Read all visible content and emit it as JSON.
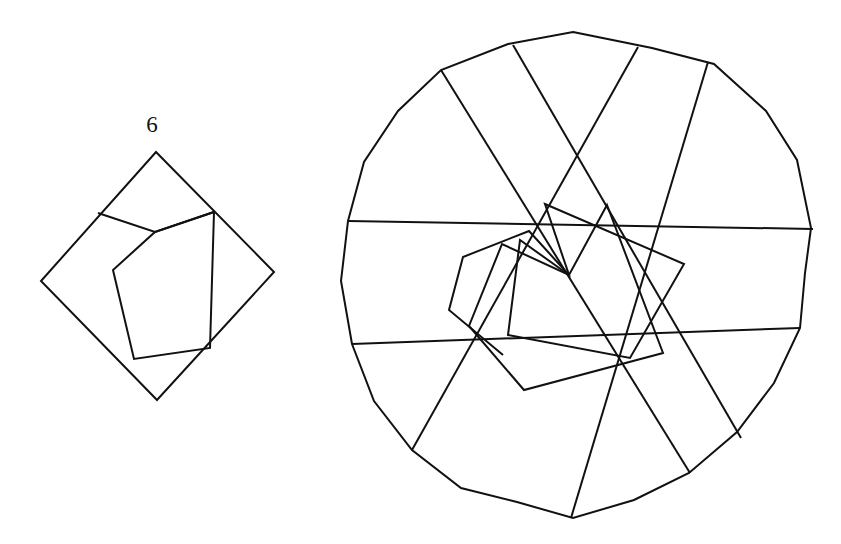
{
  "figure": {
    "kind": "geometric-line-drawing",
    "background_color": "#ffffff",
    "line_color": "#111111",
    "line_width": 2
  },
  "labels": [
    {
      "name": "figure-number",
      "text": "6",
      "x": 152,
      "y": 132,
      "font_size": 23
    }
  ],
  "chart_data": {
    "type": "line",
    "title": "",
    "xlabel": "",
    "ylabel": "",
    "grid": false,
    "legend": "none",
    "xlim": [
      0,
      841
    ],
    "ylim": [
      0,
      544
    ],
    "note": "Coordinates are image pixel positions, y increases downward. Each series is one closed or open polyline of the drawing.",
    "series": [
      {
        "name": "small-outer-square",
        "closed": true,
        "points": [
          [
            156,
            152
          ],
          [
            274,
            272
          ],
          [
            157,
            400
          ],
          [
            41,
            281
          ]
        ]
      },
      {
        "name": "small-inner-whirl",
        "closed": true,
        "points": [
          [
            98,
            213
          ],
          [
            214,
            212
          ],
          [
            210,
            348
          ],
          [
            134,
            359
          ],
          [
            113,
            270
          ],
          [
            155,
            232
          ]
        ]
      },
      {
        "name": "small-chord-upper-left",
        "closed": false,
        "points": [
          [
            98,
            213
          ],
          [
            155,
            232
          ]
        ]
      },
      {
        "name": "small-chord-upper-right",
        "closed": false,
        "points": [
          [
            155,
            232
          ],
          [
            214,
            212
          ]
        ]
      },
      {
        "name": "large-outer-14gon",
        "closed": true,
        "points": [
          [
            573,
            32
          ],
          [
            651,
            48
          ],
          [
            714,
            63
          ],
          [
            766,
            110
          ],
          [
            797,
            160
          ],
          [
            811,
            227
          ],
          [
            805,
            273
          ],
          [
            799,
            327
          ],
          [
            774,
            382
          ],
          [
            737,
            432
          ],
          [
            688,
            473
          ],
          [
            634,
            500
          ],
          [
            573,
            518
          ],
          [
            517,
            502
          ],
          [
            460,
            488
          ],
          [
            412,
            449
          ],
          [
            374,
            400
          ],
          [
            351,
            343
          ],
          [
            341,
            281
          ],
          [
            348,
            222
          ],
          [
            364,
            162
          ],
          [
            398,
            111
          ],
          [
            444,
            69
          ],
          [
            508,
            44
          ]
        ]
      },
      {
        "name": "large-ring1-polygon",
        "closed": true,
        "points": [
          [
            513,
            45
          ],
          [
            736,
            271
          ],
          [
            640,
            487
          ],
          [
            358,
            448
          ],
          [
            348,
            221
          ],
          [
            570,
            85
          ]
        ]
      },
      {
        "name": "large-ring2-polygon",
        "closed": true,
        "points": [
          [
            594,
            56
          ],
          [
            766,
            329
          ],
          [
            519,
            503
          ],
          [
            359,
            343
          ],
          [
            414,
            112
          ],
          [
            700,
            58
          ]
        ]
      },
      {
        "name": "large-chord-a",
        "closed": false,
        "points": [
          [
            348,
            221
          ],
          [
            813,
            228
          ]
        ]
      },
      {
        "name": "large-chord-b",
        "closed": false,
        "points": [
          [
            351,
            343
          ],
          [
            800,
            328
          ]
        ]
      },
      {
        "name": "large-chord-c",
        "closed": false,
        "points": [
          [
            513,
            45
          ],
          [
            740,
            438
          ]
        ]
      },
      {
        "name": "large-chord-d",
        "closed": false,
        "points": [
          [
            637,
            47
          ],
          [
            412,
            450
          ]
        ]
      },
      {
        "name": "large-chord-e",
        "closed": false,
        "points": [
          [
            707,
            62
          ],
          [
            570,
            518
          ]
        ]
      },
      {
        "name": "large-chord-f",
        "closed": false,
        "points": [
          [
            441,
            70
          ],
          [
            690,
            473
          ]
        ]
      },
      {
        "name": "large-inner-whirl-1",
        "closed": true,
        "points": [
          [
            607,
            205
          ],
          [
            663,
            353
          ],
          [
            524,
            390
          ],
          [
            469,
            326
          ],
          [
            502,
            244
          ],
          [
            569,
            275
          ]
        ]
      },
      {
        "name": "large-inner-whirl-2",
        "closed": true,
        "points": [
          [
            545,
            204
          ],
          [
            684,
            264
          ],
          [
            630,
            358
          ],
          [
            508,
            335
          ],
          [
            520,
            240
          ],
          [
            569,
            275
          ]
        ]
      },
      {
        "name": "large-inner-whirl-3",
        "closed": false,
        "points": [
          [
            569,
            275
          ],
          [
            529,
            231
          ],
          [
            463,
            257
          ],
          [
            449,
            310
          ],
          [
            503,
            355
          ]
        ]
      }
    ]
  },
  "polylines": {
    "small_figure": {
      "name": "small-whirl-figure",
      "paths": [
        {
          "name": "outer-square",
          "closed": true,
          "d": "M156,152 L274,272 L157,400 L41,281 Z"
        },
        {
          "name": "inner-whirl",
          "closed": false,
          "d": "M98,213 L155,232 L214,212"
        },
        {
          "name": "inner-pentagon",
          "closed": true,
          "d": "M155,232 L214,212 L210,348 L134,359 L113,270 Z"
        }
      ]
    },
    "large_figure": {
      "name": "large-whirl-figure",
      "paths": [
        {
          "name": "outer-14gon",
          "closed": true,
          "d": "M573,32 L652,48 L714,64 L766,111 L797,160 L811,228 L805,273 L800,328 L774,383 L737,432 L689,473 L634,500 L573,518 L517,502 L461,488 L412,450 L374,401 L352,344 L341,281 L348,221 L364,162 L398,111 L441,70 L508,44 Z"
        },
        {
          "name": "spiral-chord-1",
          "closed": false,
          "d": "M348,221 L813,229"
        },
        {
          "name": "spiral-chord-2",
          "closed": false,
          "d": "M352,344 L800,328"
        },
        {
          "name": "spiral-chord-3",
          "closed": false,
          "d": "M513,45 L741,438"
        },
        {
          "name": "spiral-chord-4",
          "closed": false,
          "d": "M638,47 L412,450"
        },
        {
          "name": "spiral-chord-5",
          "closed": false,
          "d": "M708,62 L571,518"
        },
        {
          "name": "spiral-chord-6",
          "closed": false,
          "d": "M441,70 L690,473"
        },
        {
          "name": "inner-whirl-ring-a",
          "closed": true,
          "d": "M607,205 L663,353 L524,390 L469,326 L502,244 L569,275 Z"
        },
        {
          "name": "inner-whirl-ring-b",
          "closed": true,
          "d": "M545,204 L684,264 L630,358 L508,335 L520,240 L569,275 Z"
        },
        {
          "name": "inner-whirl-ring-c",
          "closed": false,
          "d": "M569,275 L529,231 L463,257 L449,310 L503,355"
        }
      ]
    }
  }
}
